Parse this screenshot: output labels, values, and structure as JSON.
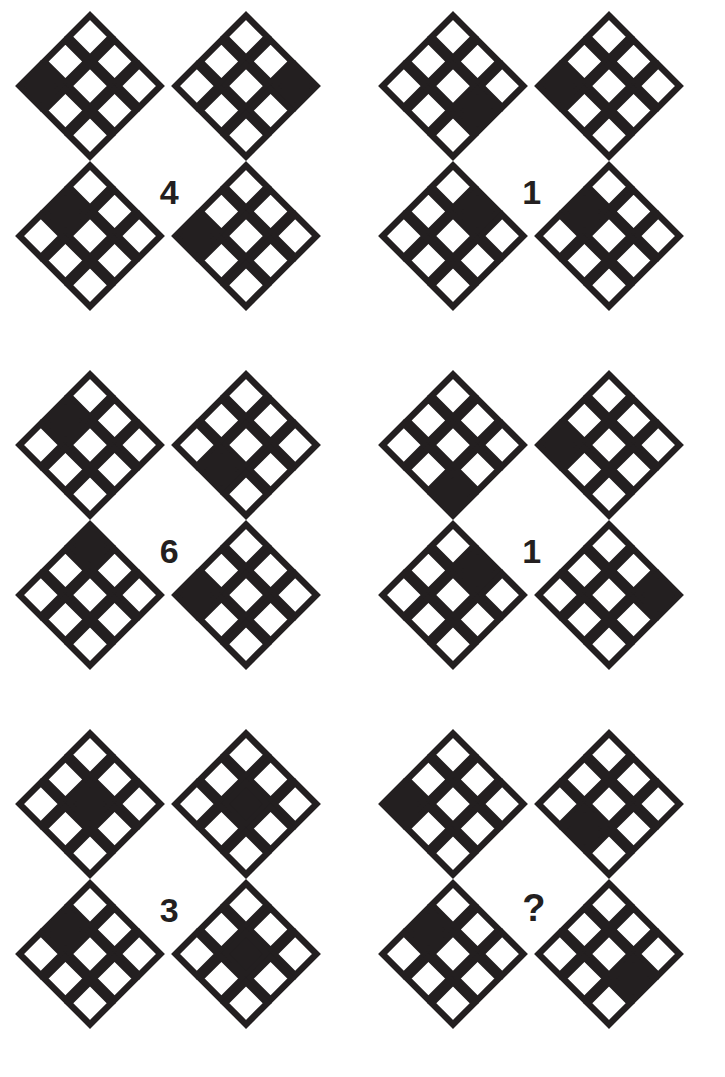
{
  "page": {
    "background_color": "#ffffff",
    "ink_color": "#231f20",
    "fill_color": "#231f20",
    "empty_color": "#ffffff"
  },
  "legend": {
    "cell_positions": [
      "N",
      "NE",
      "W",
      "C",
      "E",
      "SW",
      "SE",
      "NW",
      "S"
    ],
    "grid_note": "Each diamond is a 3x3 grid rotated 45 degrees; exactly one cell is filled solid."
  },
  "groups": [
    {
      "id": "group-1",
      "label": "4",
      "is_question": false,
      "row": 1,
      "col": 1,
      "diamonds": [
        {
          "slot": "tl",
          "filled": "W"
        },
        {
          "slot": "tr",
          "filled": "E"
        },
        {
          "slot": "bl",
          "filled": "NW"
        },
        {
          "slot": "br",
          "filled": "W"
        }
      ]
    },
    {
      "id": "group-2",
      "label": "1",
      "is_question": false,
      "row": 1,
      "col": 2,
      "diamonds": [
        {
          "slot": "tl",
          "filled": "SE"
        },
        {
          "slot": "tr",
          "filled": "W"
        },
        {
          "slot": "bl",
          "filled": "NE"
        },
        {
          "slot": "br",
          "filled": "NW"
        }
      ]
    },
    {
      "id": "group-3",
      "label": "6",
      "is_question": false,
      "row": 2,
      "col": 1,
      "diamonds": [
        {
          "slot": "tl",
          "filled": "NW"
        },
        {
          "slot": "tr",
          "filled": "SW"
        },
        {
          "slot": "bl",
          "filled": "N"
        },
        {
          "slot": "br",
          "filled": "W"
        }
      ]
    },
    {
      "id": "group-4",
      "label": "1",
      "is_question": false,
      "row": 2,
      "col": 2,
      "diamonds": [
        {
          "slot": "tl",
          "filled": "S"
        },
        {
          "slot": "tr",
          "filled": "W"
        },
        {
          "slot": "bl",
          "filled": "NE"
        },
        {
          "slot": "br",
          "filled": "E"
        }
      ]
    },
    {
      "id": "group-5",
      "label": "3",
      "is_question": false,
      "row": 3,
      "col": 1,
      "diamonds": [
        {
          "slot": "tl",
          "filled": "C"
        },
        {
          "slot": "tr",
          "filled": "C"
        },
        {
          "slot": "bl",
          "filled": "NW"
        },
        {
          "slot": "br",
          "filled": "C"
        }
      ]
    },
    {
      "id": "group-6",
      "label": "?",
      "is_question": true,
      "row": 3,
      "col": 2,
      "diamonds": [
        {
          "slot": "tl",
          "filled": "W"
        },
        {
          "slot": "tr",
          "filled": "SW"
        },
        {
          "slot": "bl",
          "filled": "NW"
        },
        {
          "slot": "br",
          "filled": "SE"
        }
      ]
    }
  ]
}
